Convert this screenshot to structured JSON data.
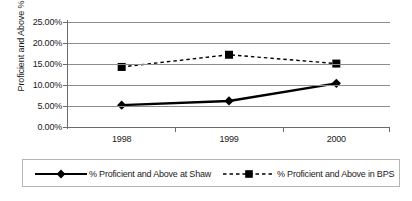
{
  "chart_data": {
    "type": "line",
    "title": "",
    "xlabel": "",
    "ylabel": "Proficient and Above %",
    "categories": [
      "1998",
      "1999",
      "2000"
    ],
    "ylim": [
      0,
      25
    ],
    "ytick_labels": [
      "25.00%",
      "20.00%",
      "15.00%",
      "10.00%",
      "5.00%",
      "0.00%"
    ],
    "ytick_values": [
      25,
      20,
      15,
      10,
      5,
      0
    ],
    "grid": true,
    "legend_position": "bottom",
    "series": [
      {
        "name": "% Proficient and Above at Shaw",
        "values": [
          5.2,
          6.2,
          10.4
        ],
        "line_style": "solid",
        "marker": "diamond",
        "color": "#000000"
      },
      {
        "name": "% Proficient and Above in BPS",
        "values": [
          14.3,
          17.2,
          15.1
        ],
        "line_style": "dashed",
        "marker": "square",
        "color": "#000000"
      }
    ]
  },
  "colors": {
    "line": "#000000",
    "gridline": "#8c8c8c",
    "axis": "#6b6b6b",
    "legend_border": "#b5b5b5",
    "background": "#ffffff",
    "text": "#1a1a1a"
  }
}
